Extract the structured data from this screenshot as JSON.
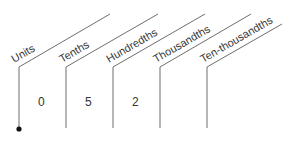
{
  "diagram": {
    "columns": [
      {
        "label": "Units",
        "digit": "0"
      },
      {
        "label": "Tenths",
        "digit": "5"
      },
      {
        "label": "Hundredths",
        "digit": "2"
      },
      {
        "label": "Thousandths",
        "digit": ""
      },
      {
        "label": "Ten-thousandths",
        "digit": ""
      }
    ],
    "decimal_point": "•",
    "colors": {
      "line": "#6e6e6e",
      "text": "#333333",
      "dot": "#111111"
    }
  }
}
